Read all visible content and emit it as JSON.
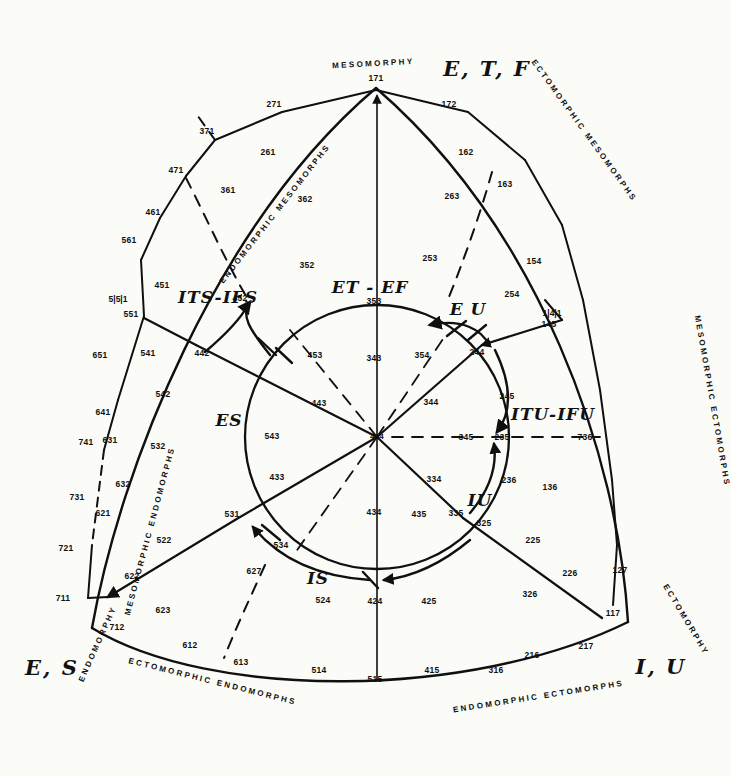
{
  "figure": {
    "background": "#fbfbf8",
    "ink": "#101010"
  },
  "poles": [
    {
      "id": "mesomorphy",
      "label": "MESOMORPHY",
      "position": "top"
    },
    {
      "id": "endomorphy",
      "label": "ENDOMORPHY",
      "position": "lower-left"
    },
    {
      "id": "ectomorphy",
      "label": "ECTOMORPHY",
      "position": "lower-right"
    }
  ],
  "edge_captions": [
    {
      "id": "endomorphic-mesomorphs",
      "label": "ENDOMORPHIC   MESOMORPHS"
    },
    {
      "id": "ectomorphic-mesomorphs",
      "label": "ECTOMORPHIC   MESOMORPHS"
    },
    {
      "id": "mesomorphic-ectomorphs",
      "label": "MESOMORPHIC   ECTOMORPHS"
    },
    {
      "id": "endomorphic-ectomorphs",
      "label": "ENDOMORPHIC  ECTOMORPHS"
    },
    {
      "id": "ectomorphic-endomorphs",
      "label": "ECTOMORPHIC   ENDOMORPHS"
    },
    {
      "id": "mesomorphic-endomorphs",
      "label": "MESOMORPHIC   ENDOMORPHS"
    }
  ],
  "corner_labels": [
    {
      "id": "corner-etf",
      "label": "E, T, F"
    },
    {
      "id": "corner-es",
      "label": "E, S"
    },
    {
      "id": "corner-iu",
      "label": "I, U"
    }
  ],
  "group_labels": [
    {
      "id": "et-ef",
      "label": "ET - EF"
    },
    {
      "id": "eu",
      "label": "E U"
    },
    {
      "id": "es",
      "label": "ES"
    },
    {
      "id": "is",
      "label": "IS"
    },
    {
      "id": "iu",
      "label": "IU"
    },
    {
      "id": "its-ifs",
      "label": "ITS-IFS"
    },
    {
      "id": "itu-ifu",
      "label": "ITU-IFU"
    }
  ],
  "bracket_marks": [
    {
      "id": "bracket-left",
      "label": "5|5|1"
    },
    {
      "id": "bracket-right",
      "label": "1|4|1"
    }
  ],
  "chart_data": {
    "type": "scatter",
    "center_code": "444",
    "codes": [
      {
        "code": "171",
        "x": 376,
        "y": 78
      },
      {
        "code": "271",
        "x": 274,
        "y": 104
      },
      {
        "code": "172",
        "x": 449,
        "y": 104
      },
      {
        "code": "371",
        "x": 207,
        "y": 131
      },
      {
        "code": "261",
        "x": 268,
        "y": 152
      },
      {
        "code": "162",
        "x": 466,
        "y": 152
      },
      {
        "code": "471",
        "x": 176,
        "y": 170
      },
      {
        "code": "361",
        "x": 228,
        "y": 190
      },
      {
        "code": "362",
        "x": 305,
        "y": 199
      },
      {
        "code": "163",
        "x": 505,
        "y": 184
      },
      {
        "code": "263",
        "x": 452,
        "y": 196
      },
      {
        "code": "461",
        "x": 153,
        "y": 212
      },
      {
        "code": "561",
        "x": 129,
        "y": 240
      },
      {
        "code": "352",
        "x": 307,
        "y": 265
      },
      {
        "code": "253",
        "x": 430,
        "y": 258
      },
      {
        "code": "154",
        "x": 534,
        "y": 261
      },
      {
        "code": "451",
        "x": 162,
        "y": 285
      },
      {
        "code": "452",
        "x": 240,
        "y": 298
      },
      {
        "code": "551",
        "x": 131,
        "y": 314
      },
      {
        "code": "254",
        "x": 512,
        "y": 294
      },
      {
        "code": "145",
        "x": 549,
        "y": 324
      },
      {
        "code": "651",
        "x": 100,
        "y": 355
      },
      {
        "code": "541",
        "x": 148,
        "y": 353
      },
      {
        "code": "442",
        "x": 202,
        "y": 353
      },
      {
        "code": "244",
        "x": 477,
        "y": 352
      },
      {
        "code": "542",
        "x": 163,
        "y": 394
      },
      {
        "code": "245",
        "x": 507,
        "y": 396
      },
      {
        "code": "641",
        "x": 103,
        "y": 412
      },
      {
        "code": "631",
        "x": 110,
        "y": 440
      },
      {
        "code": "741",
        "x": 86,
        "y": 442
      },
      {
        "code": "532",
        "x": 158,
        "y": 446
      },
      {
        "code": "235",
        "x": 502,
        "y": 437
      },
      {
        "code": "236",
        "x": 509,
        "y": 480
      },
      {
        "code": "136",
        "x": 550,
        "y": 487
      },
      {
        "code": "632",
        "x": 123,
        "y": 484
      },
      {
        "code": "621",
        "x": 103,
        "y": 513
      },
      {
        "code": "731",
        "x": 77,
        "y": 497
      },
      {
        "code": "721",
        "x": 66,
        "y": 548
      },
      {
        "code": "522",
        "x": 164,
        "y": 540
      },
      {
        "code": "622",
        "x": 132,
        "y": 576
      },
      {
        "code": "711",
        "x": 63,
        "y": 598
      },
      {
        "code": "712",
        "x": 117,
        "y": 627
      },
      {
        "code": "612",
        "x": 190,
        "y": 645
      },
      {
        "code": "623",
        "x": 163,
        "y": 610
      },
      {
        "code": "627",
        "x": 254,
        "y": 571
      },
      {
        "code": "613",
        "x": 241,
        "y": 662
      },
      {
        "code": "514",
        "x": 319,
        "y": 670
      },
      {
        "code": "515",
        "x": 375,
        "y": 679
      },
      {
        "code": "415",
        "x": 432,
        "y": 670
      },
      {
        "code": "316",
        "x": 496,
        "y": 670
      },
      {
        "code": "216",
        "x": 532,
        "y": 655
      },
      {
        "code": "217",
        "x": 586,
        "y": 646
      },
      {
        "code": "117",
        "x": 613,
        "y": 613
      },
      {
        "code": "127",
        "x": 620,
        "y": 570
      },
      {
        "code": "226",
        "x": 570,
        "y": 573
      },
      {
        "code": "326",
        "x": 530,
        "y": 594
      },
      {
        "code": "225",
        "x": 533,
        "y": 540
      },
      {
        "code": "325",
        "x": 484,
        "y": 523
      },
      {
        "code": "524",
        "x": 323,
        "y": 600
      },
      {
        "code": "424",
        "x": 375,
        "y": 601
      },
      {
        "code": "425",
        "x": 429,
        "y": 601
      },
      {
        "code": "531",
        "x": 232,
        "y": 514
      },
      {
        "code": "534",
        "x": 281,
        "y": 545
      },
      {
        "code": "335",
        "x": 456,
        "y": 513
      },
      {
        "code": "433",
        "x": 277,
        "y": 477
      },
      {
        "code": "434",
        "x": 374,
        "y": 512
      },
      {
        "code": "435",
        "x": 419,
        "y": 514
      },
      {
        "code": "334",
        "x": 434,
        "y": 479
      },
      {
        "code": "543",
        "x": 272,
        "y": 436
      },
      {
        "code": "345",
        "x": 466,
        "y": 437
      },
      {
        "code": "736",
        "x": 585,
        "y": 437
      },
      {
        "code": "443",
        "x": 319,
        "y": 403
      },
      {
        "code": "344",
        "x": 431,
        "y": 402
      },
      {
        "code": "453",
        "x": 315,
        "y": 355
      },
      {
        "code": "354",
        "x": 422,
        "y": 355
      },
      {
        "code": "343",
        "x": 374,
        "y": 358
      },
      {
        "code": "353",
        "x": 374,
        "y": 301
      }
    ]
  }
}
